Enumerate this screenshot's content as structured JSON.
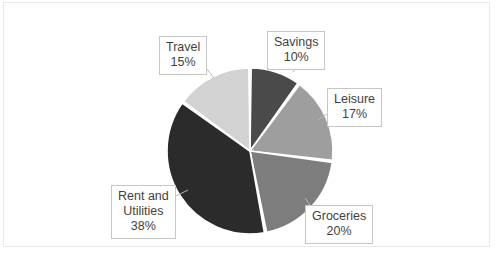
{
  "chart_data": {
    "type": "pie",
    "title": "",
    "subtitle": "",
    "xlabel": "",
    "ylabel": "",
    "legend": "none",
    "grid": false,
    "labels_inside": false,
    "label_format": "name + percent",
    "total": 100,
    "units": "%",
    "start_angle_deg": 0,
    "direction": "clockwise",
    "categories": [
      "Savings",
      "Leisure",
      "Groceries",
      "Rent and Utilities",
      "Travel"
    ],
    "values": [
      10,
      17,
      20,
      38,
      15
    ],
    "colors": [
      "#4a4a4a",
      "#9e9e9e",
      "#7d7d7d",
      "#2b2b2b",
      "#d2d2d2"
    ],
    "slices": [
      {
        "name": "Savings",
        "value": 10,
        "label": "Savings",
        "value_label": "10%",
        "color": "#4a4a4a"
      },
      {
        "name": "Leisure",
        "value": 17,
        "label": "Leisure",
        "value_label": "17%",
        "color": "#9e9e9e"
      },
      {
        "name": "Groceries",
        "value": 20,
        "label": "Groceries",
        "value_label": "20%",
        "color": "#7d7d7d"
      },
      {
        "name": "Rent and Utilities",
        "value": 38,
        "label_line1": "Rent and",
        "label_line2": "Utilities",
        "value_label": "38%",
        "color": "#2b2b2b"
      },
      {
        "name": "Travel",
        "value": 15,
        "label": "Travel",
        "value_label": "15%",
        "color": "#d2d2d2"
      }
    ]
  },
  "geometry": {
    "center_x": 250,
    "center_y": 151,
    "radius": 83,
    "gap_deg": 1.6,
    "separator_color": "#ffffff"
  },
  "style": {
    "background": "#ffffff",
    "frame_color": "#e9e9e9",
    "callout_border": "#c6c6c6",
    "text_color": "#3f3f3f"
  }
}
